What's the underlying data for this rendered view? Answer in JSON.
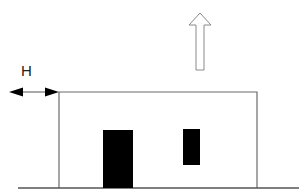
{
  "diagram": {
    "labels": {
      "H": "H"
    },
    "colors": {
      "outline": "#6b6b6b",
      "fill_dark": "#000000",
      "ground": "#555555",
      "background": "#ffffff"
    },
    "elements": [
      {
        "name": "house-outline",
        "type": "rectangle-outline"
      },
      {
        "name": "door",
        "type": "filled-rectangle"
      },
      {
        "name": "window",
        "type": "filled-rectangle"
      },
      {
        "name": "ground-line",
        "type": "line"
      },
      {
        "name": "height-dimension-arrow",
        "type": "double-headed-arrow",
        "label": "H"
      },
      {
        "name": "upward-arrow",
        "type": "hollow-block-arrow",
        "direction": "up"
      }
    ]
  }
}
